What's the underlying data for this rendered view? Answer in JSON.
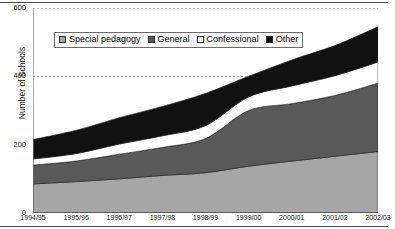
{
  "figure": {
    "y_axis_title": "Number of Schools",
    "legend_box_name": "chart-legend"
  },
  "chart_data": {
    "type": "area",
    "stacked": true,
    "title": "",
    "subtitle": "",
    "xlabel": "",
    "ylabel": "Number of Schools",
    "ylim": [
      0,
      600
    ],
    "yticks": [
      0,
      200,
      400,
      600
    ],
    "ytick_labels": [
      "0",
      "200",
      "400",
      "600"
    ],
    "grid": "horizontal-dashed",
    "legend_position": "top-center-inside",
    "categories": [
      "1994/95",
      "1995/96",
      "1996/97",
      "1997/98",
      "1998/99",
      "1999/00",
      "2000/01",
      "2001/02",
      "2002/03"
    ],
    "series": [
      {
        "name": "Special pedagogy",
        "color": "#a6a6a6",
        "values": [
          85,
          92,
          100,
          110,
          118,
          137,
          152,
          166,
          180
        ]
      },
      {
        "name": "General",
        "color": "#595959",
        "values": [
          55,
          60,
          72,
          82,
          100,
          163,
          168,
          178,
          200
        ]
      },
      {
        "name": "Confessional",
        "color": "#ffffff",
        "values": [
          18,
          22,
          30,
          34,
          38,
          40,
          52,
          58,
          62
        ]
      },
      {
        "name": "Other",
        "color": "#111111",
        "values": [
          57,
          68,
          77,
          86,
          94,
          60,
          76,
          88,
          103
        ]
      }
    ],
    "totals": [
      215,
      242,
      279,
      312,
      350,
      400,
      448,
      490,
      545
    ],
    "annotations": []
  },
  "legend": {
    "items": [
      {
        "label": "Special pedagogy",
        "color": "#a6a6a6"
      },
      {
        "label": "General",
        "color": "#595959"
      },
      {
        "label": "Confessional",
        "color": "#ffffff"
      },
      {
        "label": "Other",
        "color": "#111111"
      }
    ]
  }
}
